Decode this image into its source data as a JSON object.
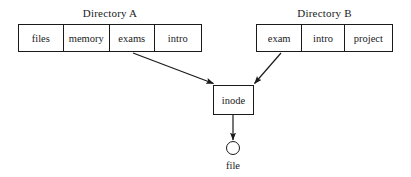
{
  "diagram": {
    "background_color": "#ffffff",
    "line_color": "#1a1a1a",
    "directories": [
      {
        "label": "Directory A",
        "entries": [
          "files",
          "memory",
          "exams",
          "intro"
        ],
        "linked_entry": "exams"
      },
      {
        "label": "Directory B",
        "entries": [
          "exam",
          "intro",
          "project"
        ],
        "linked_entry": "exam"
      }
    ],
    "inode": {
      "label": "inode"
    },
    "file": {
      "label": "file",
      "shape": "circle"
    },
    "arrows": [
      {
        "name": "dirA-exams-to-inode",
        "from": "exams",
        "to": "inode"
      },
      {
        "name": "dirB-exam-to-inode",
        "from": "exam",
        "to": "inode"
      },
      {
        "name": "inode-to-file",
        "from": "inode",
        "to": "file"
      }
    ]
  }
}
